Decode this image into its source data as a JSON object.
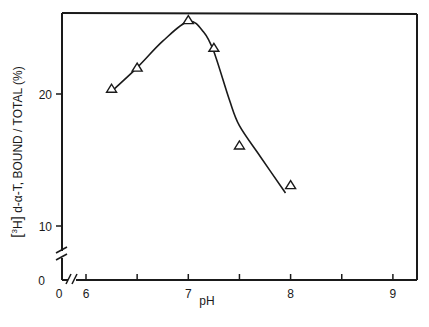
{
  "chart_data": {
    "type": "scatter",
    "title": "",
    "xlabel": "pH",
    "ylabel": "[3H] d-α-T, BOUND / TOTAL (%)",
    "ylabel_parts": {
      "bracket_open": "[",
      "sup": "3",
      "element": "H",
      "bracket_close": "]",
      "rest": " d-α-T, BOUND / TOTAL (%)"
    },
    "xlim": [
      6,
      9.25
    ],
    "ylim": [
      0,
      26.2
    ],
    "x_ticks": [
      6,
      6.5,
      7,
      7.5,
      8,
      8.5,
      9
    ],
    "x_tick_labels": [
      {
        "value": 0,
        "label": "0"
      },
      {
        "value": 6,
        "label": "6"
      },
      {
        "value": 7,
        "label": "7"
      },
      {
        "value": 8,
        "label": "8"
      },
      {
        "value": 9,
        "label": "9"
      }
    ],
    "y_ticks": [
      10,
      20
    ],
    "y_tick_labels": [
      {
        "value": 0,
        "label": "0"
      },
      {
        "value": 10,
        "label": "10"
      },
      {
        "value": 20,
        "label": "20"
      }
    ],
    "axis_breaks": {
      "x": true,
      "y": true
    },
    "grid": false,
    "legend": null,
    "marker": "open-triangle",
    "series": [
      {
        "name": "d-α-T bound/total",
        "x": [
          6.25,
          6.5,
          7.0,
          7.25,
          7.5,
          8.0
        ],
        "y": [
          20.4,
          22.0,
          25.6,
          23.5,
          16.1,
          13.1
        ]
      }
    ],
    "fitted_curve": {
      "x": [
        6.25,
        6.5,
        6.75,
        7.0,
        7.15,
        7.25,
        7.4,
        7.5,
        7.7,
        7.95
      ],
      "y": [
        20.2,
        22.0,
        24.0,
        25.5,
        24.7,
        23.2,
        19.6,
        17.6,
        15.3,
        12.5
      ]
    }
  }
}
